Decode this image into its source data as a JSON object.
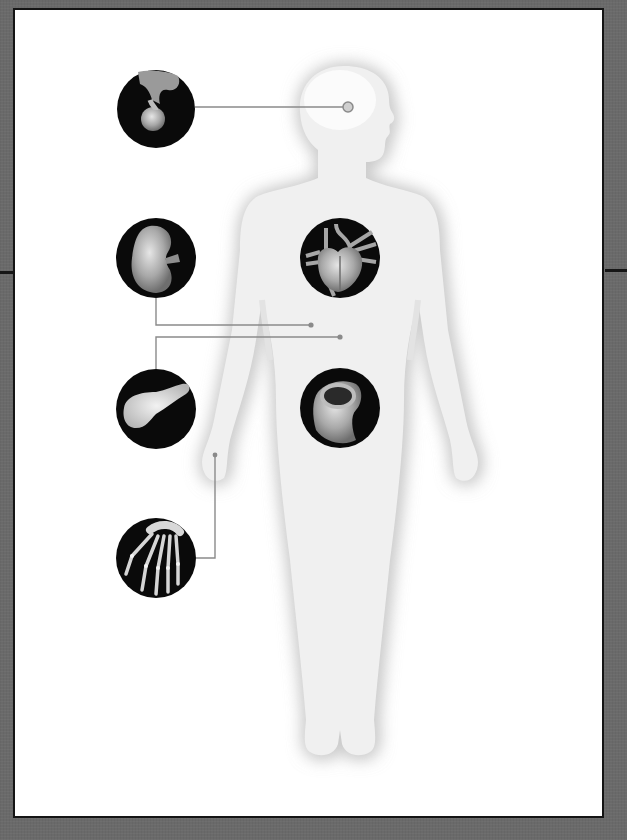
{
  "figure": {
    "type": "anatomical-diagram",
    "palette": {
      "background": "#6a6a6a",
      "panel": "#ffffff",
      "frame": "#141414",
      "silhouette": "#f1f1f1",
      "silhouette_shadow": "#c8c8c8",
      "connector": "#8c8c8c",
      "callout_fill": "#0a0a0a"
    },
    "callouts": [
      {
        "organ": "pituitary-gland",
        "side": "left",
        "cx": 156,
        "cy": 109,
        "r": 39,
        "target": [
          348,
          107
        ]
      },
      {
        "organ": "kidney",
        "side": "left",
        "cx": 156,
        "cy": 258,
        "r": 40,
        "target": [
          311,
          325
        ]
      },
      {
        "organ": "heart",
        "side": "body",
        "cx": 340,
        "cy": 258,
        "r": 40,
        "target": null
      },
      {
        "organ": "pancreas",
        "side": "left",
        "cx": 156,
        "cy": 409,
        "r": 40,
        "target": [
          340,
          337
        ]
      },
      {
        "organ": "intestine",
        "side": "body",
        "cx": 340,
        "cy": 408,
        "r": 40,
        "target": null
      },
      {
        "organ": "hand-skeleton",
        "side": "left",
        "cx": 156,
        "cy": 558,
        "r": 40,
        "target": [
          215,
          455
        ]
      }
    ]
  }
}
